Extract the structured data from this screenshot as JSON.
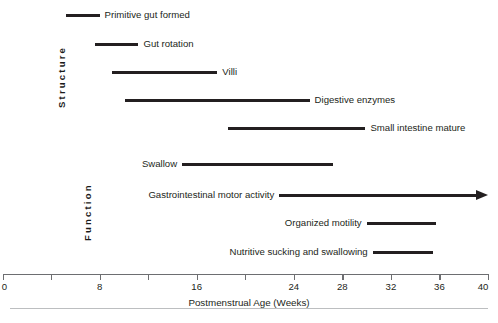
{
  "chart_data": {
    "type": "bar",
    "orientation": "horizontal",
    "title": "",
    "xlabel": "Postmenstrual Age (Weeks)",
    "ylabel": "",
    "xlim": [
      0,
      40
    ],
    "grid": false,
    "legend": "none",
    "xticks": [
      0,
      4,
      8,
      12,
      16,
      20,
      24,
      28,
      32,
      36,
      40
    ],
    "xtick_labels": [
      "0",
      "",
      "8",
      "",
      "16",
      "",
      "24",
      "28",
      "32",
      "36",
      "40"
    ],
    "groups": [
      {
        "name": "Structure",
        "bars": [
          {
            "label": "Primitive gut formed",
            "start": 5.2,
            "end": 8.0,
            "label_side": "after",
            "arrow": false
          },
          {
            "label": "Gut rotation",
            "start": 7.6,
            "end": 11.2,
            "label_side": "after",
            "arrow": false
          },
          {
            "label": "Villi",
            "start": 9.0,
            "end": 17.7,
            "label_side": "after",
            "arrow": false
          },
          {
            "label": "Digestive enzymes",
            "start": 10.1,
            "end": 25.3,
            "label_side": "after",
            "arrow": false
          },
          {
            "label": "Small intestine mature",
            "start": 18.6,
            "end": 29.9,
            "label_side": "after",
            "arrow": false
          }
        ]
      },
      {
        "name": "Function",
        "bars": [
          {
            "label": "Swallow",
            "start": 14.8,
            "end": 27.2,
            "label_side": "before",
            "arrow": false
          },
          {
            "label": "Gastrointestinal motor activity",
            "start": 22.8,
            "end": 40.0,
            "label_side": "before",
            "arrow": true
          },
          {
            "label": "Organized motility",
            "start": 30.0,
            "end": 35.7,
            "label_side": "before",
            "arrow": false
          },
          {
            "label": "Nutritive sucking and swallowing",
            "start": 30.5,
            "end": 35.5,
            "label_side": "before",
            "arrow": false
          }
        ]
      }
    ]
  },
  "axis": {
    "title": "Postmenstrual Age (Weeks)"
  },
  "groups": {
    "structure_label": "Structure",
    "function_label": "Function"
  },
  "colors": {
    "bar": "#231f20",
    "axis": "#6d6e71",
    "text": "#231f20",
    "background": "#ffffff",
    "footer_rule": "#bcbec0"
  }
}
